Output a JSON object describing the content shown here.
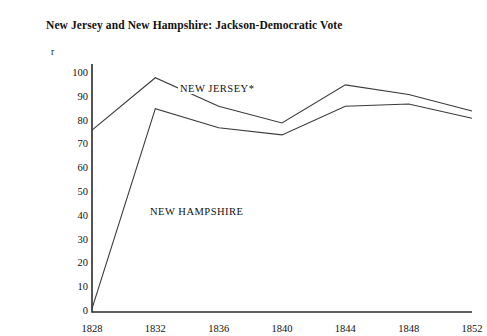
{
  "chart_data": {
    "type": "line",
    "title": "New Jersey and New Hampshire: Jackson-Democratic Vote",
    "xlabel": "",
    "ylabel": "r",
    "x": [
      1828,
      1832,
      1836,
      1840,
      1844,
      1848,
      1852
    ],
    "xticklabels": [
      "1828",
      "1832",
      "1836",
      "1840",
      "1844",
      "1848",
      "1852"
    ],
    "yticklabels": [
      "0",
      "10",
      "20",
      "30",
      "40",
      "50",
      "60",
      "70",
      "80",
      "90",
      "100"
    ],
    "yticks": [
      0,
      10,
      20,
      30,
      40,
      50,
      60,
      70,
      80,
      90,
      100
    ],
    "ylim": [
      0,
      100
    ],
    "xlim": [
      1828,
      1852
    ],
    "grid": false,
    "legend_position": "inline-annotation",
    "series": [
      {
        "name": "NEW JERSEY*",
        "label": "NEW JERSEY*",
        "color": "#3a3a3a",
        "values": [
          76,
          98,
          86,
          79,
          95,
          91,
          84
        ]
      },
      {
        "name": "NEW HAMPSHIRE",
        "label": "NEW HAMPSHIRE",
        "color": "#3a3a3a",
        "values": [
          1,
          85,
          77,
          74,
          86,
          87,
          81
        ]
      }
    ],
    "annotations": [
      {
        "text": "NEW JERSEY*"
      },
      {
        "text": "NEW HAMPSHIRE"
      }
    ]
  },
  "colors": {
    "line": "#3a3a3a",
    "axis": "#2b2b2b",
    "text": "#111111",
    "background": "#ffffff"
  }
}
